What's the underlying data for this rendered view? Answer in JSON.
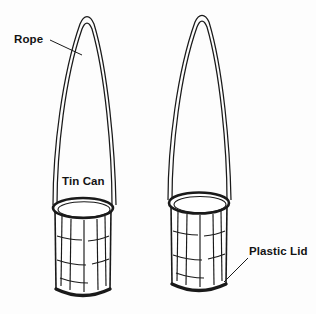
{
  "figure": {
    "background_color": "#fdfdfd",
    "ink_color": "#1a1a1a",
    "style": "black-and-white line drawing"
  },
  "labels": {
    "rope": "Rope",
    "tin_can": "Tin Can",
    "plastic_lid": "Plastic Lid"
  },
  "objects": {
    "left_can": {
      "name": "Tin Can with rope handle",
      "rim_state": "open",
      "handle": "rope loop"
    },
    "right_can": {
      "name": "Tin Can with plastic lid and rope handle",
      "rim_state": "covered",
      "handle": "rope loop"
    }
  },
  "icons": {
    "leader_line_rope": "leader-line-icon",
    "leader_line_lid": "leader-line-icon"
  }
}
